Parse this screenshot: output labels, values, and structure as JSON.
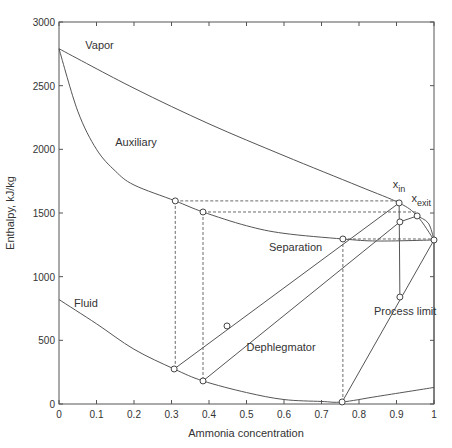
{
  "chart_data": {
    "type": "line",
    "title": "",
    "xlabel": "Ammonia concentration",
    "ylabel": "Enthalpy, kJ/kg",
    "xlim": [
      0,
      1
    ],
    "ylim": [
      0,
      3000
    ],
    "grid": false,
    "x_ticks": [
      "0",
      "0.1",
      "0.2",
      "0.3",
      "0.4",
      "0.5",
      "0.6",
      "0.7",
      "0.8",
      "0.9",
      "1"
    ],
    "y_ticks": [
      "0",
      "500",
      "1000",
      "1500",
      "2000",
      "2500",
      "3000"
    ],
    "curves": [
      {
        "name": "Vapor",
        "style": "solid",
        "points": [
          [
            0,
            2790
          ],
          [
            0.2,
            2480
          ],
          [
            0.4,
            2200
          ],
          [
            0.6,
            1950
          ],
          [
            0.8,
            1710
          ],
          [
            0.907,
            1579
          ],
          [
            0.955,
            1477
          ],
          [
            1.0,
            1288
          ]
        ]
      },
      {
        "name": "Auxiliary",
        "style": "solid",
        "points": [
          [
            0,
            2790
          ],
          [
            0.05,
            2300
          ],
          [
            0.1,
            2000
          ],
          [
            0.15,
            1830
          ],
          [
            0.2,
            1720
          ],
          [
            0.31,
            1595
          ],
          [
            0.384,
            1508
          ],
          [
            0.5,
            1400
          ],
          [
            0.6,
            1340
          ],
          [
            0.757,
            1296
          ],
          [
            0.85,
            1280
          ],
          [
            1.0,
            1288
          ]
        ]
      },
      {
        "name": "Fluid",
        "style": "solid",
        "points": [
          [
            0,
            820
          ],
          [
            0.1,
            630
          ],
          [
            0.2,
            430
          ],
          [
            0.307,
            275
          ],
          [
            0.384,
            181
          ],
          [
            0.5,
            90
          ],
          [
            0.6,
            35
          ],
          [
            0.7,
            20
          ],
          [
            0.755,
            16
          ],
          [
            0.85,
            60
          ],
          [
            1.0,
            130
          ]
        ]
      },
      {
        "name": "Separation tail",
        "style": "solid",
        "points": [
          [
            0.955,
            1477
          ],
          [
            0.985,
            1420
          ],
          [
            1.0,
            1288
          ]
        ]
      }
    ],
    "tie_lines": [
      {
        "from": [
          0.307,
          275
        ],
        "to": [
          0.907,
          1579
        ],
        "style": "solid"
      },
      {
        "from": [
          0.384,
          181
        ],
        "to": [
          0.909,
          1430
        ],
        "style": "solid"
      },
      {
        "from": [
          0.755,
          16
        ],
        "to": [
          1.0,
          1288
        ],
        "style": "solid"
      },
      {
        "from": [
          0.907,
          1579
        ],
        "to": [
          0.909,
          840
        ],
        "style": "solid"
      },
      {
        "from": [
          0.909,
          1430
        ],
        "to": [
          0.955,
          1477
        ],
        "style": "solid"
      },
      {
        "from": [
          1.0,
          1288
        ],
        "to": [
          1.0,
          0
        ],
        "style": "solid"
      }
    ],
    "dashed_lines": [
      {
        "from": [
          0.31,
          1595
        ],
        "to": [
          0.907,
          1595
        ]
      },
      {
        "from": [
          0.384,
          1508
        ],
        "to": [
          0.955,
          1508
        ]
      },
      {
        "from": [
          0.757,
          1296
        ],
        "to": [
          1.0,
          1296
        ]
      },
      {
        "from": [
          0.31,
          1595
        ],
        "to": [
          0.31,
          275
        ]
      },
      {
        "from": [
          0.384,
          1508
        ],
        "to": [
          0.384,
          181
        ]
      },
      {
        "from": [
          0.757,
          1296
        ],
        "to": [
          0.757,
          16
        ]
      }
    ],
    "markers": [
      [
        0.31,
        1595
      ],
      [
        0.384,
        1508
      ],
      [
        0.307,
        275
      ],
      [
        0.384,
        181
      ],
      [
        0.448,
        613
      ],
      [
        0.757,
        1296
      ],
      [
        0.755,
        16
      ],
      [
        0.907,
        1579
      ],
      [
        0.909,
        1430
      ],
      [
        0.955,
        1477
      ],
      [
        1.0,
        1288
      ],
      [
        0.909,
        840
      ]
    ],
    "annotations": [
      {
        "text": "Vapor",
        "x": 0.07,
        "y": 2790
      },
      {
        "text": "Auxiliary",
        "x": 0.15,
        "y": 2030
      },
      {
        "text": "Fluid",
        "x": 0.04,
        "y": 760
      },
      {
        "text": "Separation",
        "x": 0.56,
        "y": 1200
      },
      {
        "text": "Dephlegmator",
        "x": 0.5,
        "y": 420
      },
      {
        "text": "Process limit",
        "x": 0.84,
        "y": 700
      },
      {
        "text": "x",
        "sub": "in",
        "x": 0.89,
        "y": 1700
      },
      {
        "text": "x",
        "sub": "exit",
        "x": 0.94,
        "y": 1590
      }
    ]
  }
}
